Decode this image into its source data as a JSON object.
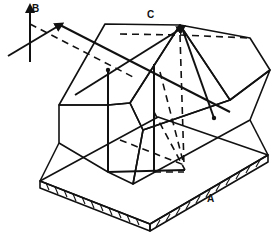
{
  "diagram": {
    "type": "technical illustration",
    "labels": {
      "a": "A",
      "b": "B",
      "c": "C"
    },
    "colors": {
      "ink": "#111111",
      "background": "#ffffff"
    }
  }
}
